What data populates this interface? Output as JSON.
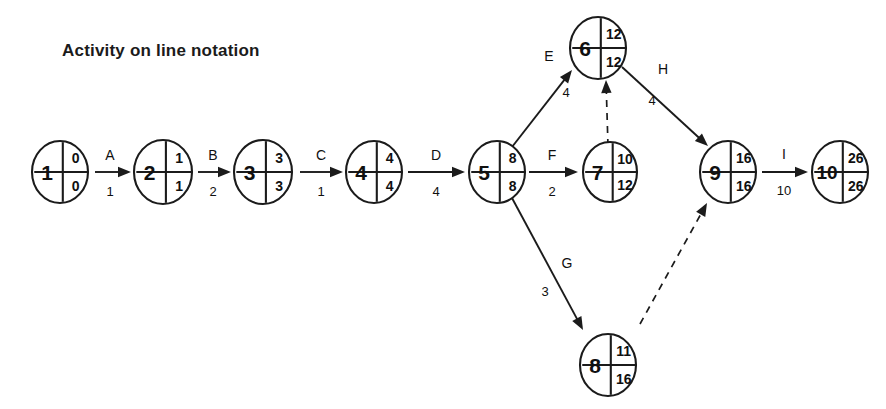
{
  "title": "Activity on line notation",
  "diagram": {
    "type": "activity-on-arrow-network",
    "node_label_fields": [
      "event_number",
      "earliest_event_time",
      "latest_event_time"
    ],
    "nodes": [
      {
        "id": "1",
        "earliest": "0",
        "latest": "0",
        "cx": 60,
        "cy": 172,
        "r": 28
      },
      {
        "id": "2",
        "earliest": "1",
        "latest": "1",
        "cx": 163,
        "cy": 172,
        "r": 29
      },
      {
        "id": "3",
        "earliest": "3",
        "latest": "3",
        "cx": 263,
        "cy": 172,
        "r": 29
      },
      {
        "id": "4",
        "earliest": "4",
        "latest": "4",
        "cx": 374,
        "cy": 172,
        "r": 28
      },
      {
        "id": "5",
        "earliest": "8",
        "latest": "8",
        "cx": 497,
        "cy": 172,
        "r": 28
      },
      {
        "id": "6",
        "earliest": "12",
        "latest": "12",
        "cx": 598,
        "cy": 48,
        "r": 28
      },
      {
        "id": "7",
        "earliest": "10",
        "latest": "12",
        "cx": 610,
        "cy": 172,
        "r": 27
      },
      {
        "id": "8",
        "earliest": "11",
        "latest": "16",
        "cx": 608,
        "cy": 365,
        "r": 28
      },
      {
        "id": "9",
        "earliest": "16",
        "latest": "16",
        "cx": 728,
        "cy": 172,
        "r": 28
      },
      {
        "id": "10",
        "earliest": "26",
        "latest": "26",
        "cx": 840,
        "cy": 172,
        "r": 28
      }
    ],
    "edges": [
      {
        "label": "A",
        "duration": "1",
        "from": "1",
        "to": "2",
        "style": "solid",
        "x1": 95,
        "y1": 172,
        "x2": 131,
        "y2": 172,
        "lx": 110,
        "ly": 155,
        "dx": 110,
        "dy": 191
      },
      {
        "label": "B",
        "duration": "2",
        "from": "2",
        "to": "3",
        "style": "solid",
        "x1": 198,
        "y1": 172,
        "x2": 231,
        "y2": 172,
        "lx": 213,
        "ly": 155,
        "dx": 213,
        "dy": 191
      },
      {
        "label": "C",
        "duration": "1",
        "from": "3",
        "to": "4",
        "style": "solid",
        "x1": 300,
        "y1": 172,
        "x2": 343,
        "y2": 172,
        "lx": 321,
        "ly": 155,
        "dx": 321,
        "dy": 191
      },
      {
        "label": "D",
        "duration": "4",
        "from": "4",
        "to": "5",
        "style": "solid",
        "x1": 408,
        "y1": 172,
        "x2": 465,
        "y2": 172,
        "lx": 436,
        "ly": 155,
        "dx": 436,
        "dy": 191
      },
      {
        "label": "E",
        "duration": "4",
        "from": "5",
        "to": "6",
        "style": "solid",
        "x1": 512,
        "y1": 147,
        "x2": 572,
        "y2": 70,
        "lx": 549,
        "ly": 56,
        "dx": 566,
        "dy": 92
      },
      {
        "label": "F",
        "duration": "2",
        "from": "5",
        "to": "7",
        "style": "solid",
        "x1": 529,
        "y1": 172,
        "x2": 578,
        "y2": 172,
        "lx": 552,
        "ly": 155,
        "dx": 552,
        "dy": 191
      },
      {
        "label": "G",
        "duration": "3",
        "from": "5",
        "to": "8",
        "style": "solid",
        "x1": 512,
        "y1": 198,
        "x2": 583,
        "y2": 330,
        "lx": 567,
        "ly": 263,
        "dx": 545,
        "dy": 291
      },
      {
        "label": "H",
        "duration": "4",
        "from": "6",
        "to": "9",
        "style": "solid",
        "x1": 622,
        "y1": 67,
        "x2": 708,
        "y2": 146,
        "lx": 663,
        "ly": 69,
        "dx": 652,
        "dy": 100
      },
      {
        "label": "I",
        "duration": "10",
        "from": "9",
        "to": "10",
        "style": "solid",
        "x1": 762,
        "y1": 172,
        "x2": 808,
        "y2": 172,
        "lx": 784,
        "ly": 154,
        "dx": 784,
        "dy": 190
      },
      {
        "label": "",
        "duration": "",
        "from": "7",
        "to": "6",
        "style": "dashed",
        "x1": 608,
        "y1": 146,
        "x2": 606,
        "y2": 80,
        "lx": 0,
        "ly": 0,
        "dx": 0,
        "dy": 0
      },
      {
        "label": "",
        "duration": "",
        "from": "8",
        "to": "9",
        "style": "dashed",
        "x1": 640,
        "y1": 324,
        "x2": 707,
        "y2": 203,
        "lx": 0,
        "ly": 0,
        "dx": 0,
        "dy": 0
      }
    ]
  }
}
